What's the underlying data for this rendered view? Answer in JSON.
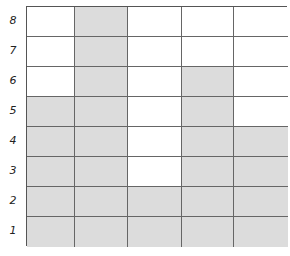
{
  "grid": {
    "rows": 8,
    "columns": 5,
    "row_labels": [
      "8",
      "7",
      "6",
      "5",
      "4",
      "3",
      "2",
      "1"
    ],
    "shaded_color": "#dcdcdc",
    "empty_color": "#ffffff",
    "cells": [
      [
        0,
        1,
        0,
        0,
        0
      ],
      [
        0,
        1,
        0,
        0,
        0
      ],
      [
        0,
        1,
        0,
        1,
        0
      ],
      [
        1,
        1,
        0,
        1,
        0
      ],
      [
        1,
        1,
        0,
        1,
        1
      ],
      [
        1,
        1,
        0,
        1,
        1
      ],
      [
        1,
        1,
        1,
        1,
        1
      ],
      [
        1,
        1,
        1,
        1,
        1
      ]
    ]
  }
}
